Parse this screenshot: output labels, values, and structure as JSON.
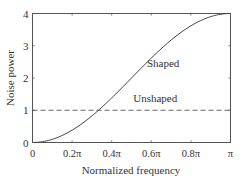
{
  "chart_data": {
    "type": "line",
    "title": "",
    "xlabel": "Normalized frequency",
    "ylabel": "Noise power",
    "xlim": [
      0,
      3.14159
    ],
    "ylim": [
      0,
      4
    ],
    "grid": false,
    "x_ticks": [
      {
        "value": 0,
        "label": "0"
      },
      {
        "value": 0.2,
        "label": "0.2π"
      },
      {
        "value": 0.4,
        "label": "0.4π"
      },
      {
        "value": 0.6,
        "label": "0.6π"
      },
      {
        "value": 0.8,
        "label": "0.8π"
      },
      {
        "value": 1.0,
        "label": "π"
      }
    ],
    "y_ticks": [
      {
        "value": 0,
        "label": "0"
      },
      {
        "value": 1,
        "label": "1"
      },
      {
        "value": 2,
        "label": "2"
      },
      {
        "value": 3,
        "label": "3"
      },
      {
        "value": 4,
        "label": "4"
      }
    ],
    "series": [
      {
        "name": "Shaped",
        "style": "solid",
        "x_over_pi": [
          0,
          0.1,
          0.2,
          0.3,
          0.4,
          0.5,
          0.6,
          0.7,
          0.8,
          0.9,
          1.0
        ],
        "values": [
          0,
          0.098,
          0.382,
          0.824,
          1.382,
          2.0,
          2.618,
          3.176,
          3.618,
          3.902,
          4.0
        ]
      },
      {
        "name": "Unshaped",
        "style": "dashed",
        "x_over_pi": [
          0,
          1.0
        ],
        "values": [
          1,
          1
        ]
      }
    ],
    "annotations": [
      {
        "text": "Shaped",
        "x_over_pi": 0.66,
        "y": 2.35
      },
      {
        "text": "Unshaped",
        "x_over_pi": 0.62,
        "y": 1.25
      }
    ]
  }
}
